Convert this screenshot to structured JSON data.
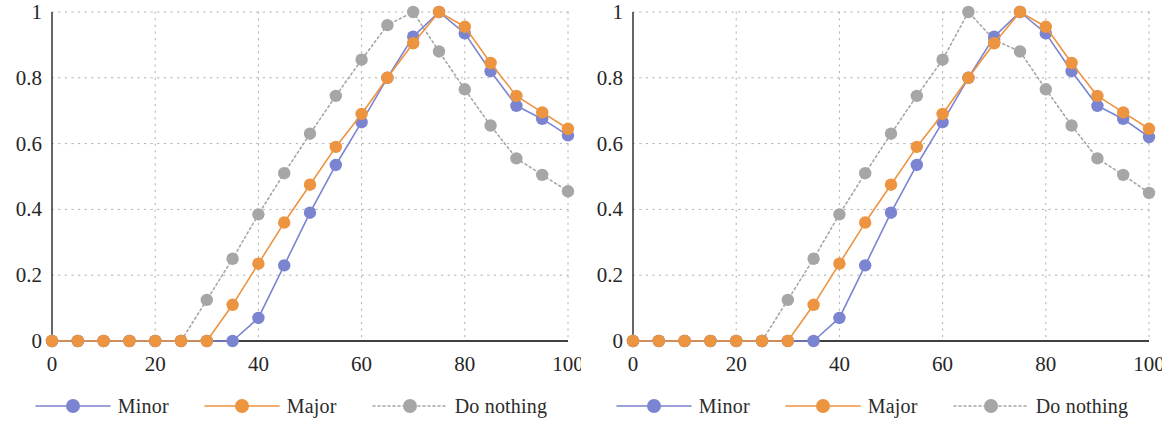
{
  "figure": {
    "panel_count": 2,
    "background": "#ffffff"
  },
  "colors": {
    "minor": "#7b84d0",
    "major": "#ed9440",
    "do_nothing": "#a6a6a6",
    "axis": "#404040",
    "grid": "#b0b0b0",
    "text": "#262626"
  },
  "legend": {
    "entries": [
      {
        "label": "Minor",
        "series": "minor",
        "color": "#7b84d0",
        "line_style": "solid"
      },
      {
        "label": "Major",
        "series": "major",
        "color": "#ed9440",
        "line_style": "solid"
      },
      {
        "label": "Do nothing",
        "series": "do_nothing",
        "color": "#a6a6a6",
        "line_style": "dotted"
      }
    ]
  },
  "chart_data": [
    {
      "type": "line",
      "panel": "left",
      "title": "",
      "xlabel": "",
      "ylabel": "",
      "xlim": [
        0,
        100
      ],
      "ylim": [
        0,
        1
      ],
      "xticks": [
        "0",
        "20",
        "40",
        "60",
        "80",
        "100"
      ],
      "xtick_values": [
        0,
        20,
        40,
        60,
        80,
        100
      ],
      "yticks": [
        "0",
        "0.2",
        "0.4",
        "0.6",
        "0.8",
        "1"
      ],
      "ytick_values": [
        0,
        0.2,
        0.4,
        0.6,
        0.8,
        1
      ],
      "grid": true,
      "grid_style": "dotted",
      "legend_position": "bottom",
      "x": [
        0,
        5,
        10,
        15,
        20,
        25,
        30,
        35,
        40,
        45,
        50,
        55,
        60,
        65,
        70,
        75,
        80,
        85,
        90,
        95,
        100
      ],
      "series": [
        {
          "name": "Minor",
          "color": "#7b84d0",
          "line_style": "solid",
          "marker": "circle",
          "values": [
            0,
            0,
            0,
            0,
            0,
            0,
            0,
            0,
            0.07,
            0.23,
            0.39,
            0.535,
            0.665,
            0.8,
            0.925,
            1.0,
            0.935,
            0.82,
            0.715,
            0.675,
            0.625
          ]
        },
        {
          "name": "Major",
          "color": "#ed9440",
          "line_style": "solid",
          "marker": "circle",
          "values": [
            0,
            0,
            0,
            0,
            0,
            0,
            0,
            0.11,
            0.235,
            0.36,
            0.475,
            0.59,
            0.69,
            0.8,
            0.905,
            1.0,
            0.955,
            0.845,
            0.745,
            0.695,
            0.645
          ]
        },
        {
          "name": "Do nothing",
          "color": "#a6a6a6",
          "line_style": "dotted",
          "marker": "circle",
          "values": [
            0,
            0,
            0,
            0,
            0,
            0,
            0.125,
            0.25,
            0.385,
            0.51,
            0.63,
            0.745,
            0.855,
            0.96,
            1.0,
            0.88,
            0.765,
            0.655,
            0.555,
            0.505,
            0.455
          ]
        }
      ]
    },
    {
      "type": "line",
      "panel": "right",
      "title": "",
      "xlabel": "",
      "ylabel": "",
      "xlim": [
        0,
        100
      ],
      "ylim": [
        0,
        1
      ],
      "xticks": [
        "0",
        "20",
        "40",
        "60",
        "80",
        "100"
      ],
      "xtick_values": [
        0,
        20,
        40,
        60,
        80,
        100
      ],
      "yticks": [
        "0",
        "0.2",
        "0.4",
        "0.6",
        "0.8",
        "1"
      ],
      "ytick_values": [
        0,
        0.2,
        0.4,
        0.6,
        0.8,
        1
      ],
      "grid": true,
      "grid_style": "dotted",
      "legend_position": "bottom",
      "x": [
        0,
        5,
        10,
        15,
        20,
        25,
        30,
        35,
        40,
        45,
        50,
        55,
        60,
        65,
        70,
        75,
        80,
        85,
        90,
        95,
        100
      ],
      "series": [
        {
          "name": "Minor",
          "color": "#7b84d0",
          "line_style": "solid",
          "marker": "circle",
          "values": [
            0,
            0,
            0,
            0,
            0,
            0,
            0,
            0,
            0.07,
            0.23,
            0.39,
            0.535,
            0.665,
            0.8,
            0.925,
            1.0,
            0.935,
            0.82,
            0.715,
            0.675,
            0.62
          ]
        },
        {
          "name": "Major",
          "color": "#ed9440",
          "line_style": "solid",
          "marker": "circle",
          "values": [
            0,
            0,
            0,
            0,
            0,
            0,
            0,
            0.11,
            0.235,
            0.36,
            0.475,
            0.59,
            0.69,
            0.8,
            0.905,
            1.0,
            0.955,
            0.845,
            0.745,
            0.695,
            0.645
          ]
        },
        {
          "name": "Do nothing",
          "color": "#a6a6a6",
          "line_style": "dotted",
          "marker": "circle",
          "values": [
            0,
            0,
            0,
            0,
            0,
            0,
            0.125,
            0.25,
            0.385,
            0.51,
            0.63,
            0.745,
            0.855,
            1.0,
            0.915,
            0.88,
            0.765,
            0.655,
            0.555,
            0.505,
            0.45
          ]
        }
      ]
    }
  ]
}
